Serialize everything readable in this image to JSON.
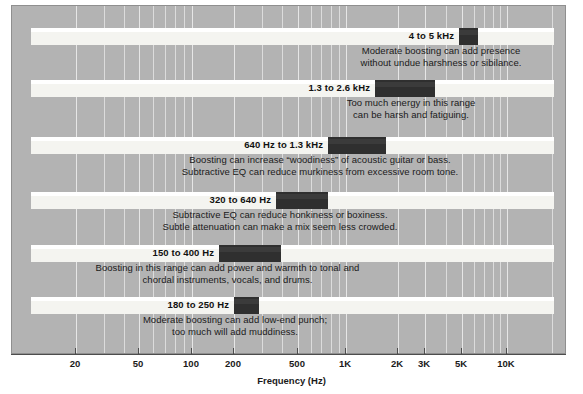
{
  "chart_data": {
    "type": "bar",
    "title": "",
    "xlabel": "Frequency (Hz)",
    "ylabel": "",
    "scale": "log",
    "xlim": [
      14,
      22000
    ],
    "grid": true,
    "legend": "none",
    "axis": {
      "label": "Frequency (Hz)",
      "ticks": [
        {
          "value": 20,
          "label": "20"
        },
        {
          "value": 50,
          "label": "50"
        },
        {
          "value": 100,
          "label": "100"
        },
        {
          "value": 200,
          "label": "200"
        },
        {
          "value": 500,
          "label": "500"
        },
        {
          "value": 1000,
          "label": "1K"
        },
        {
          "value": 2000,
          "label": "2K"
        },
        {
          "value": 3000,
          "label": "3K"
        },
        {
          "value": 5000,
          "label": "5K"
        },
        {
          "value": 10000,
          "label": "10K"
        }
      ]
    },
    "gridlines": [
      20,
      30,
      40,
      50,
      60,
      70,
      80,
      90,
      100,
      200,
      300,
      400,
      500,
      600,
      700,
      800,
      900,
      1000,
      2000,
      3000,
      4000,
      5000,
      6000,
      7000,
      8000,
      9000,
      10000,
      20000
    ],
    "categories": [
      "4 to 5 kHz",
      "1.3 to 2.6 kHz",
      "640 Hz to 1.3 kHz",
      "320 to 640 Hz",
      "150 to 400 Hz",
      "180 to 250 Hz"
    ],
    "bands": [
      {
        "label": "4 to 5 kHz",
        "low_hz": 4000,
        "high_hz": 5000,
        "description": "Moderate boosting can add presence\nwithout undue harshness or sibilance."
      },
      {
        "label": "1.3 to 2.6 kHz",
        "low_hz": 1300,
        "high_hz": 2600,
        "description": "Too much energy in this range\ncan be harsh and fatiguing."
      },
      {
        "label": "640 Hz to 1.3 kHz",
        "low_hz": 640,
        "high_hz": 1300,
        "description": "Boosting can increase “woodiness” of acoustic guitar or bass.\nSubtractive EQ can reduce murkiness from excessive room tone."
      },
      {
        "label": "320 to 640 Hz",
        "low_hz": 320,
        "high_hz": 640,
        "description": "Subtractive EQ can reduce honkiness or boxiness.\nSubtle attenuation can make a mix seem less crowded."
      },
      {
        "label": "150 to 400 Hz",
        "low_hz": 150,
        "high_hz": 400,
        "description": "Boosting in this range can add power and warmth to tonal and\nchordal instruments, vocals, and drums."
      },
      {
        "label": "180 to 250 Hz",
        "low_hz": 180,
        "high_hz": 250,
        "description": "Moderate boosting can add low-end punch;\ntoo much will add muddiness."
      }
    ]
  },
  "colors": {
    "panel_background": "#b3b3b3",
    "band_fill": "#f4f4f0",
    "highlight_bar": "#2f2f2f",
    "gridline": "#dcdcdc",
    "axis": "#4d4d4d",
    "text": "#1a1a1a"
  },
  "geometry": {
    "bands_px": [
      {
        "band_top": 27,
        "bar_left": 458,
        "bar_width": 19,
        "label_right": 454,
        "desc_top": 45,
        "desc_left": 330,
        "desc_width": 222
      },
      {
        "band_top": 79,
        "bar_left": 374,
        "bar_width": 60,
        "label_right": 370,
        "desc_top": 97,
        "desc_left": 300,
        "desc_width": 222
      },
      {
        "band_top": 136,
        "bar_left": 327,
        "bar_width": 58,
        "label_right": 323,
        "desc_top": 154,
        "desc_left": 150,
        "desc_width": 340
      },
      {
        "band_top": 191,
        "bar_left": 275,
        "bar_width": 52,
        "label_right": 271,
        "desc_top": 209,
        "desc_left": 110,
        "desc_width": 340
      },
      {
        "band_top": 244,
        "bar_left": 218,
        "bar_width": 62,
        "label_right": 214,
        "desc_top": 262,
        "desc_left": 40,
        "desc_width": 375
      },
      {
        "band_top": 296,
        "bar_left": 233,
        "bar_width": 25,
        "label_right": 229,
        "desc_top": 314,
        "desc_left": 105,
        "desc_width": 260
      }
    ],
    "tick_px": [
      75,
      138,
      191,
      233,
      297,
      345,
      397,
      424,
      461,
      506
    ]
  }
}
